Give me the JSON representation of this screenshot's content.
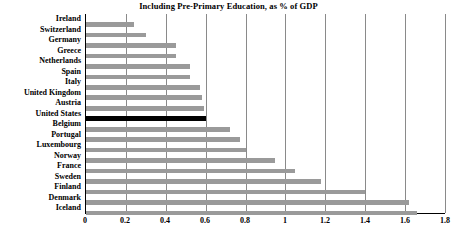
{
  "chart_data": {
    "type": "bar",
    "orientation": "horizontal",
    "title": "Including Pre-Primary Education, as % of GDP",
    "xlabel": "",
    "ylabel": "",
    "xlim": [
      0,
      1.8
    ],
    "xticks": [
      "0",
      "0.2",
      "0.4",
      "0.6",
      "0.8",
      "1",
      "1.2",
      "1.4",
      "1.6",
      "1.8"
    ],
    "xtick_values": [
      0,
      0.2,
      0.4,
      0.6,
      0.8,
      1.0,
      1.2,
      1.4,
      1.6,
      1.8
    ],
    "grid": "vertical",
    "legend": null,
    "bar_color": "#9a9a9a",
    "highlight_color": "#000000",
    "highlight_category": "United States",
    "categories": [
      "Ireland",
      "Switzerland",
      "Germany",
      "Greece",
      "Netherlands",
      "Spain",
      "Italy",
      "United Kingdom",
      "Austria",
      "United States",
      "Belgium",
      "Portugal",
      "Luxembourg",
      "Norway",
      "France",
      "Sweden",
      "Finland",
      "Denmark",
      "Iceland"
    ],
    "values": [
      0.24,
      0.3,
      0.45,
      0.45,
      0.52,
      0.52,
      0.57,
      0.58,
      0.59,
      0.6,
      0.72,
      0.77,
      0.8,
      0.95,
      1.05,
      1.18,
      1.4,
      1.62,
      1.66
    ]
  }
}
